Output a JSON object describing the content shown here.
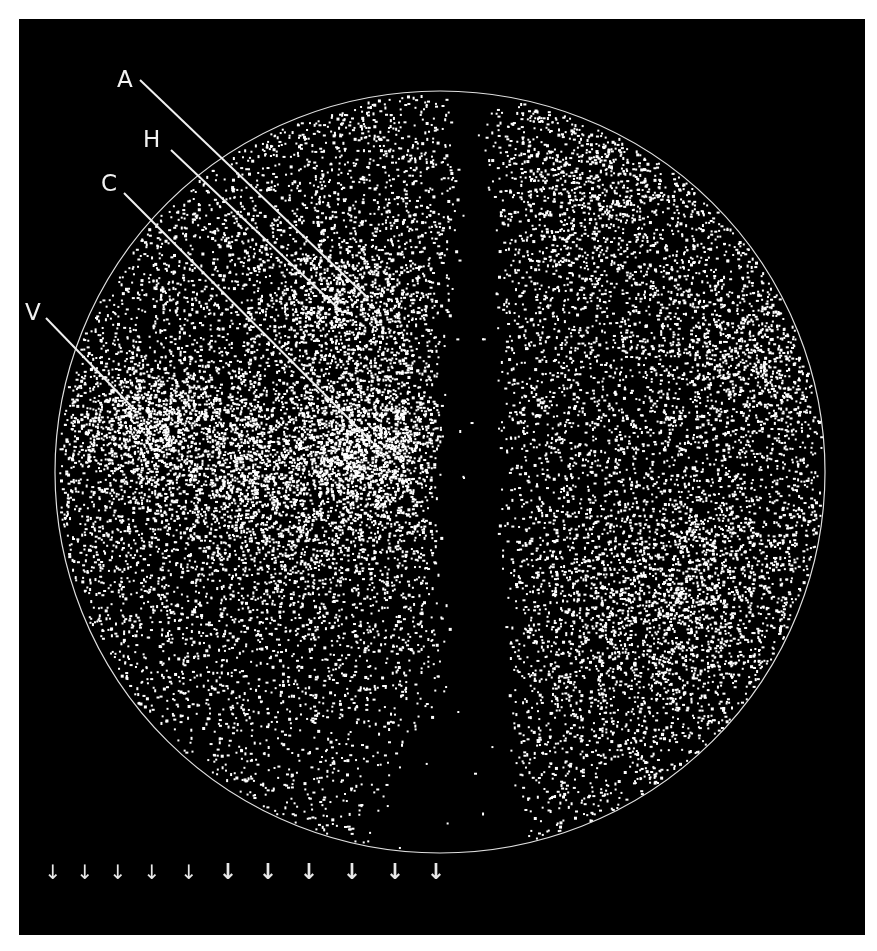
{
  "figure": {
    "type": "all-sky galaxy distribution map (equal-area projection)",
    "background_color": "#000000",
    "point_color": "#ffffff",
    "boundary_color": "#e0e0e0",
    "boundary_ellipse": {
      "cx": 440,
      "cy": 472,
      "rx": 385,
      "ry": 381
    },
    "labels": [
      {
        "id": "A",
        "text": "A",
        "x": 117,
        "y": 68,
        "line": [
          140,
          80,
          368,
          298
        ]
      },
      {
        "id": "H",
        "text": "H",
        "x": 143,
        "y": 128,
        "line": [
          171,
          150,
          343,
          313
        ]
      },
      {
        "id": "C",
        "text": "C",
        "x": 101,
        "y": 172,
        "line": [
          124,
          193,
          372,
          442
        ]
      },
      {
        "id": "V",
        "text": "V",
        "x": 25,
        "y": 301,
        "line": [
          46,
          318,
          132,
          407
        ]
      }
    ],
    "arrows": [
      {
        "x": 53,
        "bold": false
      },
      {
        "x": 85,
        "bold": false
      },
      {
        "x": 118,
        "bold": false
      },
      {
        "x": 152,
        "bold": false
      },
      {
        "x": 189,
        "bold": false
      },
      {
        "x": 228,
        "bold": true
      },
      {
        "x": 268,
        "bold": true
      },
      {
        "x": 309,
        "bold": true
      },
      {
        "x": 352,
        "bold": true
      },
      {
        "x": 395,
        "bold": true
      },
      {
        "x": 436,
        "bold": true
      }
    ],
    "arrow_glyph": "↓",
    "arrow_y": 862,
    "zone_of_avoidance": [
      {
        "y": 90,
        "x0": 440,
        "x1": 490
      },
      {
        "y": 200,
        "x0": 452,
        "x1": 500
      },
      {
        "y": 320,
        "x0": 440,
        "x1": 505
      },
      {
        "y": 450,
        "x0": 430,
        "x1": 505
      },
      {
        "y": 560,
        "x0": 430,
        "x1": 512
      },
      {
        "y": 680,
        "x0": 440,
        "x1": 515
      },
      {
        "y": 760,
        "x0": 400,
        "x1": 520
      },
      {
        "y": 860,
        "x0": 360,
        "x1": 540
      }
    ],
    "clusters": [
      {
        "name": "V",
        "x": 145,
        "y": 425,
        "r": 40,
        "weight": 1.0
      },
      {
        "name": "central-concentration",
        "x": 310,
        "y": 485,
        "r": 70,
        "weight": 1.2
      },
      {
        "name": "C",
        "x": 385,
        "y": 445,
        "r": 45,
        "weight": 1.1
      },
      {
        "name": "A-H",
        "x": 350,
        "y": 305,
        "r": 40,
        "weight": 0.8
      },
      {
        "name": "left-band",
        "x": 240,
        "y": 455,
        "r": 60,
        "weight": 0.8
      },
      {
        "name": "upper-right",
        "x": 590,
        "y": 190,
        "r": 60,
        "weight": 0.5
      },
      {
        "name": "lower-right-1",
        "x": 640,
        "y": 620,
        "r": 70,
        "weight": 0.7
      },
      {
        "name": "lower-right-2",
        "x": 700,
        "y": 560,
        "r": 50,
        "weight": 0.5
      },
      {
        "name": "right-edge",
        "x": 760,
        "y": 360,
        "r": 50,
        "weight": 0.5
      }
    ],
    "background_density": 0.62,
    "point_count": 17000,
    "seed": 7
  }
}
